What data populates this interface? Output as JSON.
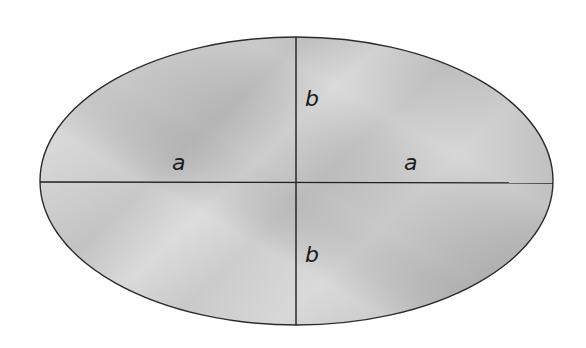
{
  "diagram": {
    "type": "ellipse-with-axes",
    "ellipse": {
      "cx": 296.5,
      "cy": 181,
      "rx": 256.5,
      "ry": 144,
      "stroke": "#2a2a2a",
      "fill_light": "#dcdcdc",
      "fill_mid": "#c6c6c6",
      "fill_dark": "#b3b3b3"
    },
    "axes": {
      "major": {
        "x1": 40,
        "y1": 182,
        "x2": 553,
        "y2": 183,
        "color": "#1e1e1e"
      },
      "minor": {
        "x1": 296,
        "y1": 37,
        "x2": 296,
        "y2": 325,
        "color": "#1e1e1e"
      }
    },
    "labels": [
      {
        "id": "semi-major-left",
        "text": "a",
        "x": 178,
        "y": 170
      },
      {
        "id": "semi-major-right",
        "text": "a",
        "x": 410,
        "y": 170
      },
      {
        "id": "semi-minor-top",
        "text": "b",
        "x": 312,
        "y": 105
      },
      {
        "id": "semi-minor-bottom",
        "text": "b",
        "x": 312,
        "y": 260
      }
    ]
  }
}
